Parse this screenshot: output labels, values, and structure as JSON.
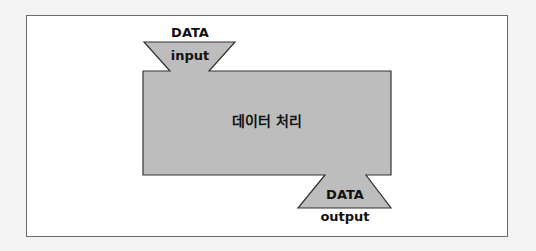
{
  "diagram": {
    "input": {
      "line1": "DATA",
      "line2": "input"
    },
    "process": {
      "label": "데이터 처리"
    },
    "output": {
      "line1": "DATA",
      "line2": "output"
    }
  },
  "colors": {
    "shape_fill": "#bdbdbd",
    "shape_stroke": "#333333",
    "frame_border": "#6a6a6a",
    "background": "#ffffff"
  }
}
